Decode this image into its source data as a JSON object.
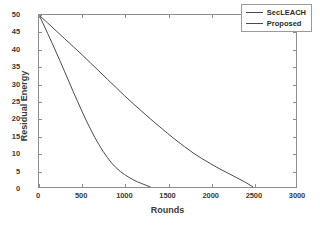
{
  "chart_data": {
    "type": "line",
    "title": "",
    "xlabel": "Rounds",
    "ylabel": "Residual Energy",
    "xlim": [
      0,
      3000
    ],
    "ylim": [
      0,
      50
    ],
    "xticks": [
      0,
      500,
      1000,
      1500,
      2000,
      2500,
      3000
    ],
    "yticks": [
      0,
      5,
      10,
      15,
      20,
      25,
      30,
      35,
      40,
      45,
      50
    ],
    "xtick_labels": [
      "0",
      "500",
      "1000",
      "1500",
      "2000",
      "2500",
      "3000"
    ],
    "ytick_labels": [
      "0",
      "5",
      "10",
      "15",
      "20",
      "25",
      "30",
      "35",
      "40",
      "45",
      "50"
    ],
    "grid": false,
    "legend_position": "upper right",
    "series": [
      {
        "name": "SecLEACH",
        "color": "#4a4a4a",
        "linewidth": 1,
        "x": [
          0,
          50,
          100,
          150,
          200,
          250,
          300,
          350,
          400,
          450,
          500,
          550,
          600,
          650,
          700,
          750,
          800,
          850,
          900,
          950,
          1000,
          1050,
          1100,
          1150,
          1200,
          1250,
          1300
        ],
        "y": [
          50,
          47.4,
          44.7,
          42.0,
          39.2,
          36.4,
          33.5,
          30.6,
          27.7,
          24.9,
          22.1,
          19.4,
          16.9,
          14.5,
          12.3,
          10.3,
          8.5,
          6.9,
          5.6,
          4.5,
          3.6,
          2.8,
          2.1,
          1.5,
          1.0,
          0.5,
          0.0
        ]
      },
      {
        "name": "Proposed",
        "color": "#4a4a4a",
        "linewidth": 1,
        "x": [
          0,
          100,
          200,
          300,
          400,
          500,
          600,
          700,
          800,
          900,
          1000,
          1100,
          1200,
          1300,
          1400,
          1500,
          1600,
          1700,
          1800,
          1900,
          2000,
          2100,
          2200,
          2300,
          2400,
          2500
        ],
        "y": [
          50,
          47.7,
          45.4,
          43.1,
          40.8,
          38.5,
          36.1,
          33.7,
          31.3,
          28.9,
          26.5,
          24.2,
          22.0,
          19.8,
          17.7,
          15.6,
          13.6,
          11.7,
          9.9,
          8.3,
          6.8,
          5.4,
          4.1,
          2.8,
          1.5,
          0.0
        ]
      }
    ]
  },
  "legend": {
    "items": [
      {
        "label": "SecLEACH",
        "color": "#4a4a4a"
      },
      {
        "label": "Proposed",
        "color": "#4a4a4a"
      }
    ]
  },
  "axes": {
    "x_title": "Rounds",
    "y_title": "Residual Energy"
  },
  "colors": {
    "axis": "#8d8d8d",
    "text": "#3a3a3a",
    "line": "#4a4a4a",
    "background": "#ffffff"
  }
}
